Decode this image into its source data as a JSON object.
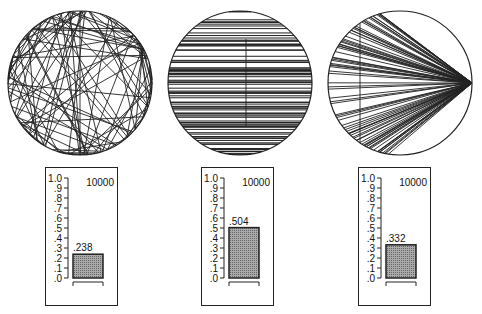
{
  "panels": [
    {
      "pattern": "random-chords",
      "trials_label": "10000",
      "value": 0.238,
      "value_label": ".238"
    },
    {
      "pattern": "parallel-chords",
      "trials_label": "10000",
      "value": 0.504,
      "value_label": ".504"
    },
    {
      "pattern": "fan-chords-from-point",
      "trials_label": "10000",
      "value": 0.332,
      "value_label": ".332"
    }
  ],
  "scale_labels": [
    "1.0",
    ".9",
    ".8",
    ".7",
    ".6",
    ".5",
    ".4",
    ".3",
    ".2",
    ".1",
    ".0"
  ],
  "chart_data": [
    {
      "type": "bar",
      "title": "",
      "categories": [
        "run"
      ],
      "values": [
        0.238
      ],
      "value_label": ".238",
      "ylim": [
        0,
        1.0
      ],
      "yticks": [
        "1.0",
        ".9",
        ".8",
        ".7",
        ".6",
        ".5",
        ".4",
        ".3",
        ".2",
        ".1",
        ".0"
      ],
      "annotation": "10000"
    },
    {
      "type": "bar",
      "title": "",
      "categories": [
        "run"
      ],
      "values": [
        0.504
      ],
      "value_label": ".504",
      "ylim": [
        0,
        1.0
      ],
      "yticks": [
        "1.0",
        ".9",
        ".8",
        ".7",
        ".6",
        ".5",
        ".4",
        ".3",
        ".2",
        ".1",
        ".0"
      ],
      "annotation": "10000"
    },
    {
      "type": "bar",
      "title": "",
      "categories": [
        "run"
      ],
      "values": [
        0.332
      ],
      "value_label": ".332",
      "ylim": [
        0,
        1.0
      ],
      "yticks": [
        "1.0",
        ".9",
        ".8",
        ".7",
        ".6",
        ".5",
        ".4",
        ".3",
        ".2",
        ".1",
        ".0"
      ],
      "annotation": "10000"
    }
  ]
}
